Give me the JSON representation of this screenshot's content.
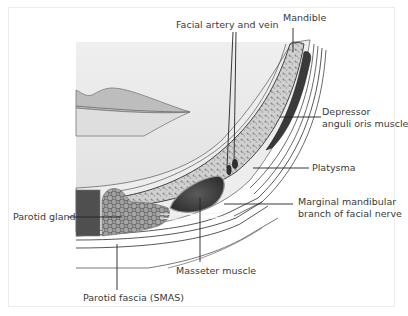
{
  "diagram": {
    "type": "anatomical-cross-section",
    "colors": {
      "bone_fill": "#c9c9c9",
      "muscle_dark": "#4a4a4a",
      "gland_fill": "#8f8f8f",
      "soft_tissue": "#e6e6e6",
      "line": "#333333",
      "text": "#3a3a3a"
    },
    "labels": {
      "facial_artery_vein": "Facial artery and vein",
      "mandible": "Mandible",
      "depressor_line1": "Depressor",
      "depressor_line2": "anguli oris muscle",
      "platysma": "Platysma",
      "marginal_line1": "Marginal mandibular",
      "marginal_line2": "branch of facial nerve",
      "parotid_gland": "Parotid gland",
      "masseter": "Masseter muscle",
      "parotid_fascia": "Parotid fascia (SMAS)"
    }
  }
}
